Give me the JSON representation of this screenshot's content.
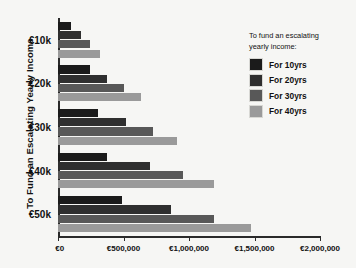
{
  "chart_data": {
    "type": "bar",
    "orientation": "horizontal",
    "title": "",
    "xlabel": "",
    "ylabel": "To Fund an Escalating Yearly Income",
    "categories": [
      "€10k",
      "€20k",
      "€30k",
      "€40k",
      "€50k"
    ],
    "xlim": [
      0,
      2000000
    ],
    "xticks": [
      0,
      500000,
      1000000,
      1500000,
      2000000
    ],
    "xtick_labels": [
      "€0",
      "€500,000",
      "€1,000,000",
      "€1,500,000",
      "€2,000,000"
    ],
    "grid": false,
    "legend_position": "right",
    "legend_title": "To fund an escalating yearly income:",
    "series": [
      {
        "name": "For 10yrs",
        "color": "#1b1b1b",
        "values": [
          100000,
          245000,
          305000,
          375000,
          485000
        ]
      },
      {
        "name": "For 20yrs",
        "color": "#2f2f2f",
        "values": [
          175000,
          375000,
          520000,
          700000,
          860000
        ]
      },
      {
        "name": "For 30yrs",
        "color": "#585858",
        "values": [
          245000,
          505000,
          725000,
          955000,
          1190000
        ]
      },
      {
        "name": "For 40yrs",
        "color": "#9a9a9a",
        "values": [
          320000,
          630000,
          905000,
          1190000,
          1475000
        ]
      }
    ]
  },
  "axis": {
    "y_title": "To Fund an Escalating Yearly Income"
  },
  "legend": {
    "title_line1": "To fund an escalating",
    "title_line2": "yearly income:",
    "items": [
      {
        "label": "For 10yrs",
        "color": "#1b1b1b"
      },
      {
        "label": "For 20yrs",
        "color": "#2f2f2f"
      },
      {
        "label": "For 30yrs",
        "color": "#585858"
      },
      {
        "label": "For 40yrs",
        "color": "#9a9a9a"
      }
    ]
  },
  "colors": {
    "background": "#f6f6f4",
    "axis": "#2a2a2a",
    "text": "#111111"
  }
}
